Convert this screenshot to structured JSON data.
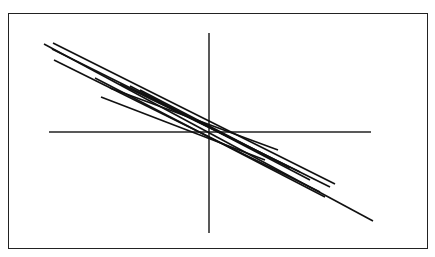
{
  "chart_data": {
    "type": "line",
    "title": "",
    "xlabel": "",
    "ylabel": "",
    "grid": false,
    "legend": null,
    "frame": {
      "x": 8,
      "y": 13,
      "width": 420,
      "height": 236
    },
    "axes": {
      "vertical": {
        "x": 209,
        "y1": 33,
        "y2": 233
      },
      "horizontal": {
        "y": 132,
        "x1": 49,
        "x2": 371
      }
    },
    "colors": {
      "line": "#111111",
      "axis": "#222222",
      "frame": "#222222",
      "background": "#ffffff"
    },
    "series": [
      {
        "name": "line-1",
        "x1": 44,
        "y1": 44,
        "x2": 373,
        "y2": 221
      },
      {
        "name": "line-2",
        "x1": 53,
        "y1": 43,
        "x2": 335,
        "y2": 184
      },
      {
        "name": "line-3",
        "x1": 52,
        "y1": 49,
        "x2": 330,
        "y2": 187
      },
      {
        "name": "line-4",
        "x1": 54,
        "y1": 60,
        "x2": 320,
        "y2": 192
      },
      {
        "name": "line-5",
        "x1": 101,
        "y1": 97,
        "x2": 265,
        "y2": 160
      },
      {
        "name": "line-6",
        "x1": 110,
        "y1": 88,
        "x2": 278,
        "y2": 150
      },
      {
        "name": "line-7",
        "x1": 120,
        "y1": 84,
        "x2": 300,
        "y2": 172
      },
      {
        "name": "line-8",
        "x1": 130,
        "y1": 86,
        "x2": 310,
        "y2": 180
      },
      {
        "name": "line-9",
        "x1": 140,
        "y1": 90,
        "x2": 290,
        "y2": 168
      },
      {
        "name": "line-10",
        "x1": 95,
        "y1": 78,
        "x2": 325,
        "y2": 197
      }
    ]
  }
}
